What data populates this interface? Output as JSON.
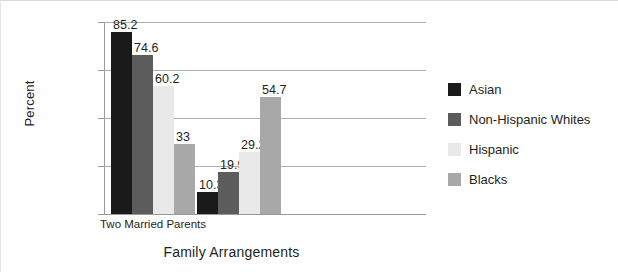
{
  "chart_data": {
    "type": "bar",
    "title": "",
    "xlabel": "Family Arrangements",
    "ylabel": "Percent",
    "categories": [
      "Two Married Parents",
      ""
    ],
    "ylim": [
      0,
      90
    ],
    "ytick_labels": [
      "0",
      "22.5",
      "45",
      "67.5",
      "90"
    ],
    "ytick_values": [
      0,
      22.5,
      45,
      67.5,
      90
    ],
    "grid": true,
    "legend_position": "right",
    "series": [
      {
        "name": "Asian",
        "color": "#1a1a1a",
        "values": [
          85.2,
          10.3
        ],
        "labels": [
          "85.2",
          "10.3"
        ]
      },
      {
        "name": "Non-Hispanic Whites",
        "color": "#5c5c5c",
        "values": [
          74.6,
          19.9
        ],
        "labels": [
          "74.6",
          "19.9"
        ]
      },
      {
        "name": "Hispanic",
        "color": "#e9e9e9",
        "values": [
          60.2,
          29.2
        ],
        "labels": [
          "60.2",
          "29.2"
        ]
      },
      {
        "name": "Blacks",
        "color": "#a8a8a8",
        "values": [
          33.0,
          54.7
        ],
        "labels": [
          "33",
          "54.7"
        ]
      }
    ]
  },
  "axes": {
    "y_title": "Percent",
    "x_title": "Family Arrangements"
  },
  "legend": {
    "items": [
      {
        "label": "Asian",
        "color": "#1a1a1a"
      },
      {
        "label": "Non-Hispanic Whites",
        "color": "#5c5c5c"
      },
      {
        "label": "Hispanic",
        "color": "#e9e9e9"
      },
      {
        "label": "Blacks",
        "color": "#a8a8a8"
      }
    ]
  }
}
